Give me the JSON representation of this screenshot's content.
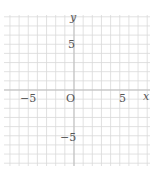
{
  "chart_data": {
    "type": "scatter",
    "title": "",
    "xlabel": "x",
    "ylabel": "y",
    "xlim": [
      -8,
      8
    ],
    "ylim": [
      -8.2,
      8.2
    ],
    "grid": true,
    "grid_step": 1,
    "x_ticks": [
      -5,
      5
    ],
    "y_ticks": [
      5,
      -5
    ],
    "tick_labels": {
      "x_neg": "−5",
      "x_pos": "5",
      "y_pos": "5",
      "y_neg": "−5",
      "origin": "O"
    },
    "series": []
  },
  "colors": {
    "grid": "#d9d9d9",
    "axis": "#bdbdbd",
    "text": "#555555"
  },
  "labels": {
    "x_axis": "x",
    "y_axis": "y",
    "origin": "O",
    "x_neg5": "−5",
    "x_pos5": "5",
    "y_pos5": "5",
    "y_neg5": "−5"
  }
}
